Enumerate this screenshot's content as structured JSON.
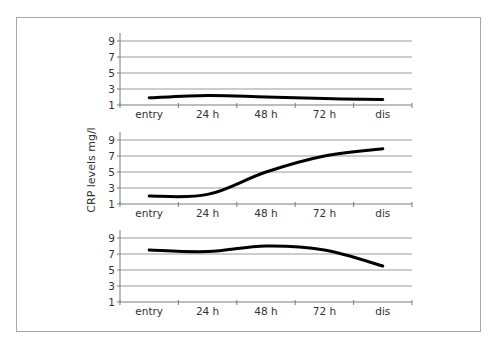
{
  "chart_data": {
    "type": "line",
    "layout": "three vertically stacked small-multiple line charts sharing one y-axis label",
    "ylabel": "CRP levels mg/l",
    "xlabel": "",
    "categories": [
      "entry",
      "24 h",
      "48 h",
      "72 h",
      "dis"
    ],
    "yticks": [
      1,
      3,
      5,
      7,
      9
    ],
    "ylim": [
      1,
      9.9
    ],
    "grid": true,
    "legend": null,
    "panels": [
      {
        "name": "top",
        "series": [
          {
            "name": "CRP",
            "values": [
              1.9,
              2.2,
              2.0,
              1.8,
              1.7
            ],
            "color": "#000000"
          }
        ]
      },
      {
        "name": "middle",
        "series": [
          {
            "name": "CRP",
            "values": [
              2.0,
              2.2,
              5.0,
              7.0,
              7.9
            ],
            "color": "#000000"
          }
        ]
      },
      {
        "name": "bottom",
        "series": [
          {
            "name": "CRP",
            "values": [
              7.5,
              7.3,
              8.0,
              7.5,
              5.5
            ],
            "color": "#000000"
          }
        ]
      }
    ]
  },
  "labels": {
    "y_axis_title": "CRP levels mg/l"
  }
}
